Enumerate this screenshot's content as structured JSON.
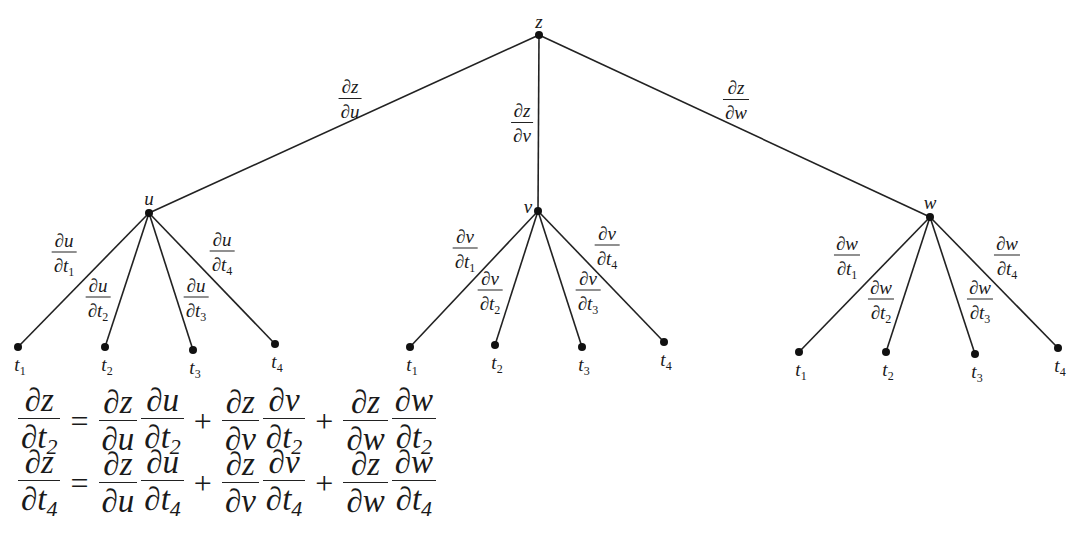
{
  "diagram": {
    "root": {
      "label": "z",
      "x": 539,
      "y": 35
    },
    "intermediate": [
      {
        "label": "u",
        "x": 149,
        "y": 213,
        "edge_label": {
          "num": "∂z",
          "den": "∂u",
          "x": 350,
          "y": 99
        },
        "leaves": [
          {
            "label": "t",
            "sub": "1",
            "x": 18,
            "y": 347,
            "edge_label": {
              "num": "∂u",
              "den": "∂t",
              "sub": "1",
              "x": 64,
              "y": 254
            }
          },
          {
            "label": "t",
            "sub": "2",
            "x": 105,
            "y": 347,
            "edge_label": {
              "num": "∂u",
              "den": "∂t",
              "sub": "2",
              "x": 98,
              "y": 299
            }
          },
          {
            "label": "t",
            "sub": "3",
            "x": 193,
            "y": 350,
            "edge_label": {
              "num": "∂u",
              "den": "∂t",
              "sub": "3",
              "x": 196,
              "y": 299
            }
          },
          {
            "label": "t",
            "sub": "4",
            "x": 275,
            "y": 344,
            "edge_label": {
              "num": "∂u",
              "den": "∂t",
              "sub": "4",
              "x": 222,
              "y": 253
            }
          }
        ]
      },
      {
        "label": "v",
        "x": 538,
        "y": 211,
        "edge_label": {
          "num": "∂z",
          "den": "∂v",
          "x": 522,
          "y": 123
        },
        "leaves": [
          {
            "label": "t",
            "sub": "1",
            "x": 410,
            "y": 347,
            "edge_label": {
              "num": "∂v",
              "den": "∂t",
              "sub": "1",
              "x": 465,
              "y": 250
            }
          },
          {
            "label": "t",
            "sub": "2",
            "x": 495,
            "y": 345,
            "edge_label": {
              "num": "∂v",
              "den": "∂t",
              "sub": "2",
              "x": 490,
              "y": 292
            }
          },
          {
            "label": "t",
            "sub": "3",
            "x": 582,
            "y": 347,
            "edge_label": {
              "num": "∂v",
              "den": "∂t",
              "sub": "3",
              "x": 588,
              "y": 292
            }
          },
          {
            "label": "t",
            "sub": "4",
            "x": 664,
            "y": 342,
            "edge_label": {
              "num": "∂v",
              "den": "∂t",
              "sub": "4",
              "x": 607,
              "y": 247
            }
          }
        ]
      },
      {
        "label": "w",
        "x": 930,
        "y": 217,
        "edge_label": {
          "num": "∂z",
          "den": "∂w",
          "x": 736,
          "y": 100
        },
        "leaves": [
          {
            "label": "t",
            "sub": "1",
            "x": 799,
            "y": 352,
            "edge_label": {
              "num": "∂w",
              "den": "∂t",
              "sub": "1",
              "x": 847,
              "y": 257
            }
          },
          {
            "label": "t",
            "sub": "2",
            "x": 886,
            "y": 352,
            "edge_label": {
              "num": "∂w",
              "den": "∂t",
              "sub": "2",
              "x": 881,
              "y": 301
            }
          },
          {
            "label": "t",
            "sub": "3",
            "x": 975,
            "y": 354,
            "edge_label": {
              "num": "∂w",
              "den": "∂t",
              "sub": "3",
              "x": 980,
              "y": 301
            }
          },
          {
            "label": "t",
            "sub": "4",
            "x": 1058,
            "y": 348,
            "edge_label": {
              "num": "∂w",
              "den": "∂t",
              "sub": "4",
              "x": 1007,
              "y": 257
            }
          }
        ]
      }
    ]
  },
  "equations": [
    {
      "lhs": {
        "num": "∂z",
        "den": "∂t",
        "sub": "2"
      },
      "terms": [
        [
          {
            "num": "∂z",
            "den": "∂u"
          },
          {
            "num": "∂u",
            "den": "∂t",
            "sub": "2"
          }
        ],
        [
          {
            "num": "∂z",
            "den": "∂v"
          },
          {
            "num": "∂v",
            "den": "∂t",
            "sub": "2"
          }
        ],
        [
          {
            "num": "∂z",
            "den": "∂w"
          },
          {
            "num": "∂w",
            "den": "∂t",
            "sub": "2"
          }
        ]
      ]
    },
    {
      "lhs": {
        "num": "∂z",
        "den": "∂t",
        "sub": "4"
      },
      "terms": [
        [
          {
            "num": "∂z",
            "den": "∂u"
          },
          {
            "num": "∂u",
            "den": "∂t",
            "sub": "4"
          }
        ],
        [
          {
            "num": "∂z",
            "den": "∂v"
          },
          {
            "num": "∂v",
            "den": "∂t",
            "sub": "4"
          }
        ],
        [
          {
            "num": "∂z",
            "den": "∂w"
          },
          {
            "num": "∂w",
            "den": "∂t",
            "sub": "4"
          }
        ]
      ]
    }
  ],
  "operators": {
    "equals": "=",
    "plus": "+"
  }
}
